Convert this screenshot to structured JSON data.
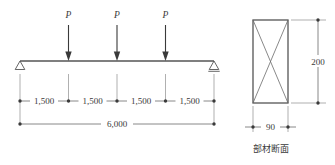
{
  "figure": {
    "title_caption": "部材断面",
    "line_color": "#555555",
    "text_color": "#3a3a3a",
    "background": "#ffffff"
  },
  "beam": {
    "span_label": "6,000",
    "segment_labels": [
      "1,500",
      "1,500",
      "1,500",
      "1,500"
    ],
    "loads": [
      {
        "label": "P"
      },
      {
        "label": "P"
      },
      {
        "label": "P"
      }
    ],
    "supports": [
      {
        "name": "pin-support-left",
        "glyph": "triangle"
      },
      {
        "name": "roller-support-right",
        "glyph": "triangle-with-line"
      }
    ]
  },
  "section": {
    "caption": "部材断面",
    "height_label": "200",
    "width_label": "90"
  }
}
